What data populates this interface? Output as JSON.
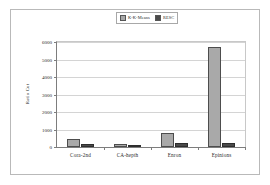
{
  "chart_data": {
    "type": "bar",
    "title": "",
    "xlabel": "",
    "ylabel": "Ratio Cut",
    "categories": [
      "Cora-2nd",
      "CA-hepth",
      "Enron",
      "Epinions"
    ],
    "series": [
      {
        "name": "K-K-Means",
        "values": [
          470,
          150,
          800,
          5700
        ],
        "color": "#a9a9a9"
      },
      {
        "name": "RESC",
        "values": [
          190,
          105,
          250,
          250
        ],
        "color": "#4a4a4a"
      }
    ],
    "ylim": [
      0,
      6000
    ],
    "yticks": [
      0,
      1000,
      2000,
      3000,
      4000,
      5000,
      6000
    ],
    "ytick_labels": [
      "0",
      "1000",
      "2000",
      "3000",
      "4000",
      "5000",
      "6000"
    ],
    "grid": "horizontal",
    "legend_position": "top-center"
  },
  "figure": {
    "background": "#ffffff",
    "frame_color": "#b9b9b9",
    "axis_color": "#7d7d7d",
    "grid_color": "#d4d4d4"
  }
}
